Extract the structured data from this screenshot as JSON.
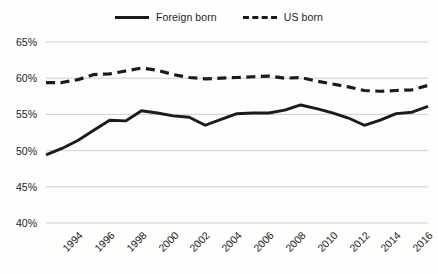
{
  "legend": {
    "position": "top-center",
    "entries": [
      {
        "label": "Foreign born",
        "style": "solid",
        "icon": "solid-line-swatch"
      },
      {
        "label": "US born",
        "style": "dashed",
        "icon": "dashed-line-swatch"
      }
    ]
  },
  "axes": {
    "y_ticks": [
      "65%",
      "60%",
      "55%",
      "50%",
      "45%",
      "40%"
    ],
    "x_ticks": [
      "1994",
      "1996",
      "1998",
      "2000",
      "2002",
      "2004",
      "2006",
      "2008",
      "2010",
      "2012",
      "2014",
      "2016",
      "2018"
    ]
  },
  "colors": {
    "line": "#1b1b1b",
    "gridline": "#c9c9c9",
    "background": "#fdfdfc",
    "text": "#1c1c1c"
  },
  "chart_data": {
    "type": "line",
    "title": "",
    "subtitle": "",
    "xlabel": "",
    "ylabel": "",
    "grid": true,
    "gridlines": "horizontal",
    "legend_position": "top-center",
    "ylim": [
      40,
      65
    ],
    "ytick_values": [
      65,
      60,
      55,
      50,
      45,
      40
    ],
    "ytick_labels": [
      "65%",
      "60%",
      "55%",
      "50%",
      "45%",
      "40%"
    ],
    "xlim": [
      1994,
      2018
    ],
    "xtick_values": [
      1994,
      1996,
      1998,
      2000,
      2002,
      2004,
      2006,
      2008,
      2010,
      2012,
      2014,
      2016,
      2018
    ],
    "x": [
      1994,
      1995,
      1996,
      1997,
      1998,
      1999,
      2000,
      2001,
      2002,
      2003,
      2004,
      2005,
      2006,
      2007,
      2008,
      2009,
      2010,
      2011,
      2012,
      2013,
      2014,
      2015,
      2016,
      2017,
      2018
    ],
    "series": [
      {
        "name": "Foreign born",
        "style": "solid",
        "values": [
          49.4,
          50.3,
          51.4,
          52.8,
          54.2,
          54.1,
          55.5,
          55.2,
          54.8,
          54.6,
          53.5,
          54.3,
          55.1,
          55.2,
          55.2,
          55.6,
          56.3,
          55.8,
          55.2,
          54.5,
          53.5,
          54.2,
          55.1,
          55.3,
          56.1
        ]
      },
      {
        "name": "US born",
        "style": "dashed",
        "values": [
          59.4,
          59.4,
          59.8,
          60.5,
          60.6,
          61.0,
          61.4,
          61.1,
          60.5,
          60.1,
          59.9,
          60.0,
          60.1,
          60.2,
          60.3,
          60.0,
          60.1,
          59.6,
          59.2,
          58.8,
          58.3,
          58.2,
          58.3,
          58.4,
          59.0
        ]
      }
    ]
  }
}
